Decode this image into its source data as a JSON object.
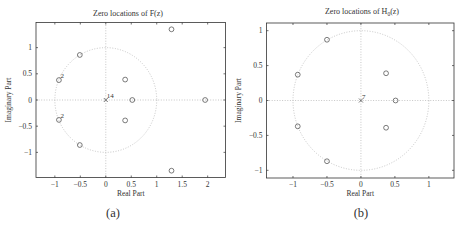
{
  "figure": {
    "panels": [
      {
        "caption": "(a)"
      },
      {
        "caption": "(b)"
      }
    ]
  },
  "chart_data": [
    {
      "type": "scatter",
      "subtype": "pole-zero plot",
      "title": "Zero locations of F(z)",
      "title_parts": {
        "main": "Zero locations of F",
        "sub": "",
        "end": "(z)"
      },
      "xlabel": "Real Part",
      "ylabel": "Imaginary Part",
      "xlim": [
        -1.37,
        2.35
      ],
      "ylim": [
        -1.48,
        1.48
      ],
      "xticks": [
        -1,
        -0.5,
        0,
        0.5,
        1,
        1.5,
        2
      ],
      "xtick_labels": [
        "−1",
        "−0.5",
        "0",
        "0.5",
        "1",
        "1.5",
        "2"
      ],
      "yticks": [
        -1,
        -0.5,
        0,
        0.5,
        1
      ],
      "ytick_labels": [
        "−1",
        "−0.5",
        "0",
        "0.5",
        "1"
      ],
      "grid": false,
      "unit_circle": true,
      "zeros": [
        {
          "x": 1.29,
          "y": 1.35,
          "multiplicity": 1
        },
        {
          "x": -0.51,
          "y": 0.86,
          "multiplicity": 1
        },
        {
          "x": -0.92,
          "y": 0.38,
          "multiplicity": 2
        },
        {
          "x": 0.38,
          "y": 0.39,
          "multiplicity": 1
        },
        {
          "x": 0.52,
          "y": 0.0,
          "multiplicity": 1
        },
        {
          "x": 1.95,
          "y": 0.0,
          "multiplicity": 1
        },
        {
          "x": -0.92,
          "y": -0.38,
          "multiplicity": 2
        },
        {
          "x": 0.38,
          "y": -0.39,
          "multiplicity": 1
        },
        {
          "x": -0.51,
          "y": -0.86,
          "multiplicity": 1
        },
        {
          "x": 1.29,
          "y": -1.35,
          "multiplicity": 1
        }
      ],
      "poles": [
        {
          "x": 0.0,
          "y": 0.0,
          "multiplicity": 14
        }
      ],
      "caption": "(a)"
    },
    {
      "type": "scatter",
      "subtype": "pole-zero plot",
      "title": "Zero locations of H0(z)",
      "title_parts": {
        "main": "Zero locations of H",
        "sub": "0",
        "end": "(z)"
      },
      "xlabel": "Real Part",
      "ylabel": "Imaginary Part",
      "xlim": [
        -1.39,
        1.37
      ],
      "ylim": [
        -1.11,
        1.11
      ],
      "xticks": [
        -1,
        -0.5,
        0,
        0.5,
        1
      ],
      "xtick_labels": [
        "−1",
        "−0.5",
        "0",
        "0.5",
        "1"
      ],
      "yticks": [
        -1,
        -0.5,
        0,
        0.5,
        1
      ],
      "ytick_labels": [
        "−1",
        "−0.5",
        "0",
        "0.5",
        "1"
      ],
      "grid": false,
      "unit_circle": true,
      "zeros": [
        {
          "x": -0.5,
          "y": 0.87,
          "multiplicity": 1
        },
        {
          "x": -0.93,
          "y": 0.37,
          "multiplicity": 1
        },
        {
          "x": 0.37,
          "y": 0.39,
          "multiplicity": 1
        },
        {
          "x": 0.51,
          "y": 0.0,
          "multiplicity": 1
        },
        {
          "x": -0.93,
          "y": -0.37,
          "multiplicity": 1
        },
        {
          "x": 0.37,
          "y": -0.39,
          "multiplicity": 1
        },
        {
          "x": -0.5,
          "y": -0.87,
          "multiplicity": 1
        }
      ],
      "poles": [
        {
          "x": 0.0,
          "y": 0.0,
          "multiplicity": 7
        }
      ],
      "caption": "(b)"
    }
  ]
}
